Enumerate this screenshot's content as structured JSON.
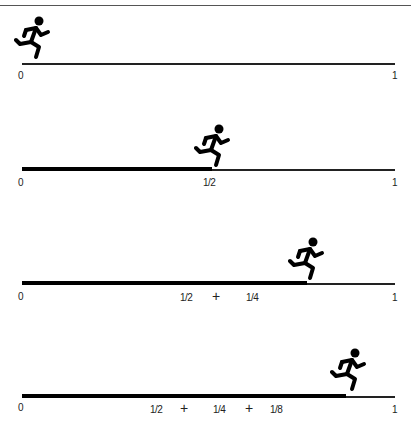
{
  "figure": {
    "panels": [
      {
        "start_label": "0",
        "end_label": "1",
        "progress": 0,
        "terms": []
      },
      {
        "start_label": "0",
        "end_label": "1",
        "progress": 0.5,
        "terms": [
          "1/2"
        ]
      },
      {
        "start_label": "0",
        "end_label": "1",
        "progress": 0.75,
        "terms": [
          "1/2",
          "+",
          "1/4"
        ]
      },
      {
        "start_label": "0",
        "end_label": "1",
        "progress": 0.875,
        "terms": [
          "1/2",
          "+",
          "1/4",
          "+",
          "1/8"
        ]
      }
    ]
  },
  "labels": {
    "zero": "0",
    "one": "1",
    "half": "1/2",
    "quarter": "1/4",
    "eighth": "1/8",
    "plus": "+"
  },
  "colors": {
    "line": "#222222",
    "bar": "#000000",
    "runner": "#000000"
  }
}
